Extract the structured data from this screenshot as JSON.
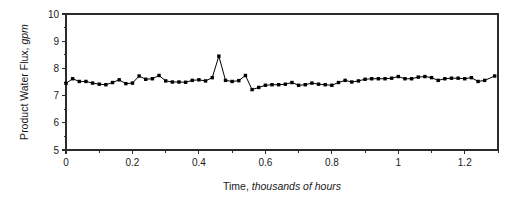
{
  "chart_data": {
    "type": "line",
    "title": "",
    "xlabel_plain": "Time, ",
    "xlabel_italic": "thousands of hours",
    "xlabel": "Time, thousands of hours",
    "ylabel_plain": "Product Water Flux, ",
    "ylabel_italic": "gpm",
    "ylabel": "Product Water Flux, gpm",
    "xlim": [
      0,
      1.3
    ],
    "ylim": [
      5,
      10
    ],
    "xticks": [
      0,
      0.2,
      0.4,
      0.6,
      0.8,
      1,
      1.2
    ],
    "xtick_labels": [
      "0",
      "0.2",
      "0.4",
      "0.6",
      "0.8",
      "1",
      "1.2"
    ],
    "xminor_step": 0.1,
    "yticks": [
      5,
      6,
      7,
      8,
      9,
      10
    ],
    "ytick_labels": [
      "5",
      "6",
      "7",
      "8",
      "9",
      "10"
    ],
    "grid": false,
    "legend": false,
    "marker": "square",
    "marker_size": 3.4,
    "line_color": "#000000",
    "marker_color": "#000000",
    "axis_color": "#2b2b2b",
    "background": "#ffffff",
    "series": [
      {
        "name": "Product Water Flux",
        "x": [
          0.0,
          0.02,
          0.04,
          0.06,
          0.08,
          0.1,
          0.12,
          0.14,
          0.16,
          0.18,
          0.2,
          0.22,
          0.24,
          0.26,
          0.28,
          0.3,
          0.32,
          0.34,
          0.36,
          0.38,
          0.4,
          0.42,
          0.44,
          0.46,
          0.48,
          0.5,
          0.52,
          0.54,
          0.56,
          0.58,
          0.6,
          0.62,
          0.64,
          0.66,
          0.68,
          0.7,
          0.72,
          0.74,
          0.76,
          0.78,
          0.8,
          0.82,
          0.84,
          0.86,
          0.88,
          0.9,
          0.92,
          0.94,
          0.96,
          0.98,
          1.0,
          1.02,
          1.04,
          1.06,
          1.08,
          1.1,
          1.12,
          1.14,
          1.16,
          1.18,
          1.2,
          1.22,
          1.24,
          1.26,
          1.29
        ],
        "y": [
          7.45,
          7.62,
          7.52,
          7.52,
          7.46,
          7.42,
          7.4,
          7.48,
          7.58,
          7.44,
          7.46,
          7.72,
          7.6,
          7.62,
          7.74,
          7.54,
          7.5,
          7.5,
          7.49,
          7.56,
          7.58,
          7.54,
          7.66,
          8.45,
          7.56,
          7.52,
          7.55,
          7.74,
          7.22,
          7.3,
          7.38,
          7.4,
          7.4,
          7.42,
          7.48,
          7.38,
          7.4,
          7.46,
          7.42,
          7.4,
          7.38,
          7.48,
          7.56,
          7.5,
          7.54,
          7.6,
          7.62,
          7.62,
          7.62,
          7.64,
          7.7,
          7.62,
          7.62,
          7.68,
          7.7,
          7.66,
          7.56,
          7.62,
          7.64,
          7.64,
          7.62,
          7.66,
          7.52,
          7.56,
          7.72
        ]
      }
    ]
  },
  "figure": {
    "plot_left": 66,
    "plot_right": 498,
    "plot_top": 14,
    "plot_bottom": 150
  }
}
